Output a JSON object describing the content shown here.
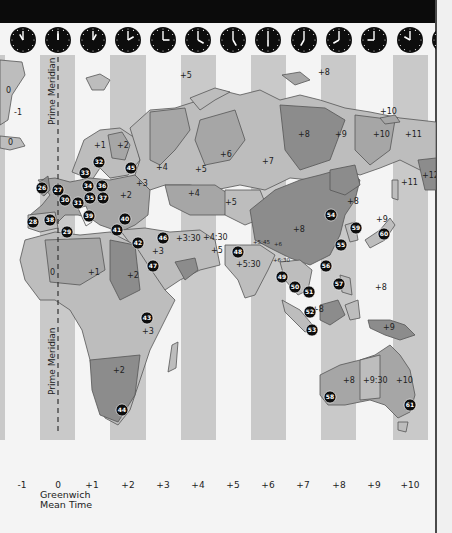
{
  "map": {
    "title": "World Time Zones",
    "prime_meridian_label": "Prime Meridian",
    "gmt_label_line1": "Greenwich",
    "gmt_label_line2": "Mean Time",
    "colors": {
      "background": "#f4f4f4",
      "strip": "#c9c9c9",
      "land_light": "#bdbdbd",
      "land_mid": "#a6a6a6",
      "land_dark": "#8c8c8c",
      "marker": "#0d0d0d",
      "topbar": "#0b0b0b"
    },
    "zones": [
      {
        "label": "-1",
        "x": 22
      },
      {
        "label": "0",
        "x": 58
      },
      {
        "label": "+1",
        "x": 92
      },
      {
        "label": "+2",
        "x": 128
      },
      {
        "label": "+3",
        "x": 163
      },
      {
        "label": "+4",
        "x": 198
      },
      {
        "label": "+5",
        "x": 233
      },
      {
        "label": "+6",
        "x": 268
      },
      {
        "label": "+7",
        "x": 303
      },
      {
        "label": "+8",
        "x": 339
      },
      {
        "label": "+9",
        "x": 374
      },
      {
        "label": "+10",
        "x": 410
      }
    ],
    "strips": [
      {
        "zone": "-1",
        "x": 0,
        "w": 5
      },
      {
        "zone": "0",
        "x": 40,
        "w": 35
      },
      {
        "zone": "+2",
        "x": 110,
        "w": 36
      },
      {
        "zone": "+4",
        "x": 181,
        "w": 35
      },
      {
        "zone": "+6",
        "x": 251,
        "w": 35
      },
      {
        "zone": "+8",
        "x": 321,
        "w": 35
      },
      {
        "zone": "+10",
        "x": 393,
        "w": 35
      }
    ],
    "clocks": [
      {
        "cx": 23,
        "hour": 11
      },
      {
        "cx": 58,
        "hour": 12
      },
      {
        "cx": 93,
        "hour": 1
      },
      {
        "cx": 128,
        "hour": 2
      },
      {
        "cx": 163,
        "hour": 3
      },
      {
        "cx": 198,
        "hour": 4
      },
      {
        "cx": 233,
        "hour": 5
      },
      {
        "cx": 268,
        "hour": 6
      },
      {
        "cx": 304,
        "hour": 7
      },
      {
        "cx": 339,
        "hour": 8
      },
      {
        "cx": 374,
        "hour": 9
      },
      {
        "cx": 410,
        "hour": 10
      },
      {
        "cx": 445,
        "hour": 11
      }
    ],
    "region_labels": [
      {
        "text": "0",
        "x": 6,
        "y": 93
      },
      {
        "text": "-1",
        "x": 14,
        "y": 115
      },
      {
        "text": "0",
        "x": 8,
        "y": 145
      },
      {
        "text": "+1",
        "x": 94,
        "y": 148
      },
      {
        "text": "+2",
        "x": 117,
        "y": 148
      },
      {
        "text": "+5",
        "x": 180,
        "y": 78
      },
      {
        "text": "+8",
        "x": 318,
        "y": 75
      },
      {
        "text": "+10",
        "x": 380,
        "y": 114
      },
      {
        "text": "+8",
        "x": 298,
        "y": 137
      },
      {
        "text": "+9",
        "x": 335,
        "y": 137
      },
      {
        "text": "+10",
        "x": 373,
        "y": 137
      },
      {
        "text": "+11",
        "x": 405,
        "y": 137
      },
      {
        "text": "+6",
        "x": 220,
        "y": 157
      },
      {
        "text": "+7",
        "x": 262,
        "y": 164
      },
      {
        "text": "+4",
        "x": 156,
        "y": 170
      },
      {
        "text": "+5",
        "x": 195,
        "y": 172
      },
      {
        "text": "+3",
        "x": 136,
        "y": 186
      },
      {
        "text": "+2",
        "x": 120,
        "y": 198
      },
      {
        "text": "+11",
        "x": 401,
        "y": 185
      },
      {
        "text": "+12",
        "x": 422,
        "y": 178
      },
      {
        "text": "+4",
        "x": 188,
        "y": 196
      },
      {
        "text": "+5",
        "x": 225,
        "y": 205
      },
      {
        "text": "+8",
        "x": 347,
        "y": 204
      },
      {
        "text": "+9",
        "x": 376,
        "y": 222
      },
      {
        "text": "+3:30",
        "x": 176,
        "y": 241
      },
      {
        "text": "+4:30",
        "x": 203,
        "y": 240
      },
      {
        "text": "+8",
        "x": 293,
        "y": 232
      },
      {
        "text": "+5",
        "x": 211,
        "y": 253
      },
      {
        "text": "+3",
        "x": 152,
        "y": 254
      },
      {
        "text": "+5:30",
        "x": 236,
        "y": 267
      },
      {
        "text": "0",
        "x": 50,
        "y": 275
      },
      {
        "text": "+1",
        "x": 88,
        "y": 275
      },
      {
        "text": "+2",
        "x": 127,
        "y": 278
      },
      {
        "text": "+8",
        "x": 375,
        "y": 290
      },
      {
        "text": "+8",
        "x": 312,
        "y": 312
      },
      {
        "text": "+9",
        "x": 383,
        "y": 330
      },
      {
        "text": "+3",
        "x": 142,
        "y": 334
      },
      {
        "text": "+2",
        "x": 113,
        "y": 373
      },
      {
        "text": "+8",
        "x": 343,
        "y": 383
      },
      {
        "text": "+9:30",
        "x": 363,
        "y": 383
      },
      {
        "text": "+10",
        "x": 396,
        "y": 383
      }
    ],
    "small_labels": [
      {
        "text": "+5:45",
        "x": 253,
        "y": 244
      },
      {
        "text": "+6",
        "x": 274,
        "y": 246
      },
      {
        "text": "+6:30",
        "x": 273,
        "y": 262
      }
    ],
    "markers": [
      {
        "n": "26",
        "x": 42,
        "y": 188
      },
      {
        "n": "27",
        "x": 58,
        "y": 190
      },
      {
        "n": "32",
        "x": 99,
        "y": 162
      },
      {
        "n": "33",
        "x": 85,
        "y": 173
      },
      {
        "n": "34",
        "x": 88,
        "y": 186
      },
      {
        "n": "36",
        "x": 102,
        "y": 186
      },
      {
        "n": "45",
        "x": 131,
        "y": 168
      },
      {
        "n": "30",
        "x": 65,
        "y": 200
      },
      {
        "n": "31",
        "x": 78,
        "y": 203
      },
      {
        "n": "35",
        "x": 90,
        "y": 198
      },
      {
        "n": "37",
        "x": 103,
        "y": 198
      },
      {
        "n": "28",
        "x": 33,
        "y": 222
      },
      {
        "n": "38",
        "x": 50,
        "y": 220
      },
      {
        "n": "39",
        "x": 89,
        "y": 216
      },
      {
        "n": "29",
        "x": 67,
        "y": 232
      },
      {
        "n": "40",
        "x": 125,
        "y": 219
      },
      {
        "n": "41",
        "x": 117,
        "y": 230
      },
      {
        "n": "42",
        "x": 138,
        "y": 243
      },
      {
        "n": "46",
        "x": 163,
        "y": 238
      },
      {
        "n": "47",
        "x": 153,
        "y": 266
      },
      {
        "n": "43",
        "x": 147,
        "y": 318
      },
      {
        "n": "44",
        "x": 122,
        "y": 410
      },
      {
        "n": "48",
        "x": 238,
        "y": 252
      },
      {
        "n": "49",
        "x": 282,
        "y": 277
      },
      {
        "n": "50",
        "x": 295,
        "y": 287
      },
      {
        "n": "51",
        "x": 309,
        "y": 292
      },
      {
        "n": "52",
        "x": 310,
        "y": 312
      },
      {
        "n": "53",
        "x": 312,
        "y": 330
      },
      {
        "n": "54",
        "x": 331,
        "y": 215
      },
      {
        "n": "55",
        "x": 341,
        "y": 245
      },
      {
        "n": "56",
        "x": 326,
        "y": 266
      },
      {
        "n": "57",
        "x": 339,
        "y": 284
      },
      {
        "n": "59",
        "x": 356,
        "y": 228
      },
      {
        "n": "60",
        "x": 384,
        "y": 234
      },
      {
        "n": "58",
        "x": 330,
        "y": 397
      },
      {
        "n": "61",
        "x": 410,
        "y": 405
      }
    ]
  }
}
